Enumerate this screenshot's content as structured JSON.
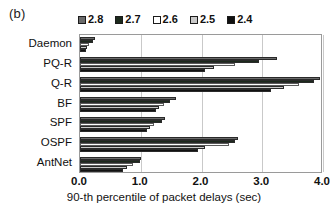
{
  "panel": {
    "letter": "(b)"
  },
  "legend": {
    "position": "top",
    "items": [
      {
        "label": "2.8",
        "color": "#6b6b6b"
      },
      {
        "label": "2.7",
        "color": "#1c2a1c"
      },
      {
        "label": "2.6",
        "color": "#ffffff"
      },
      {
        "label": "2.5",
        "color": "#c9c9c9"
      },
      {
        "label": "2.4",
        "color": "#111111"
      }
    ]
  },
  "axes": {
    "xlabel": "90-th percentile of packet delays (sec)",
    "ylabel": "",
    "xticks": [
      "0.0",
      "1.0",
      "2.0",
      "3.0",
      "4.0"
    ],
    "xlim": [
      0,
      4
    ],
    "grid": true
  },
  "chart_data": {
    "type": "bar",
    "orientation": "horizontal",
    "title": "",
    "xlabel": "90-th percentile of packet delays (sec)",
    "ylabel": "",
    "xlim": [
      0,
      4
    ],
    "xticks": [
      0.0,
      1.0,
      2.0,
      3.0,
      4.0
    ],
    "grid": true,
    "legend_position": "top",
    "categories": [
      "Daemon",
      "PQ-R",
      "Q-R",
      "BF",
      "SPF",
      "OSPF",
      "AntNet"
    ],
    "series": [
      {
        "name": "2.8",
        "color": "#6b6b6b",
        "values": [
          0.25,
          3.25,
          3.95,
          1.58,
          1.4,
          2.6,
          1.0
        ]
      },
      {
        "name": "2.7",
        "color": "#1c2a1c",
        "values": [
          0.22,
          2.95,
          3.85,
          1.48,
          1.35,
          2.55,
          0.98
        ]
      },
      {
        "name": "2.6",
        "color": "#ffffff",
        "values": [
          0.15,
          2.55,
          3.6,
          1.38,
          1.22,
          2.45,
          0.88
        ]
      },
      {
        "name": "2.5",
        "color": "#c9c9c9",
        "values": [
          0.12,
          2.2,
          3.35,
          1.3,
          1.15,
          2.05,
          0.78
        ]
      },
      {
        "name": "2.4",
        "color": "#111111",
        "values": [
          0.1,
          2.05,
          3.15,
          1.25,
          1.1,
          1.95,
          0.7
        ]
      }
    ]
  }
}
